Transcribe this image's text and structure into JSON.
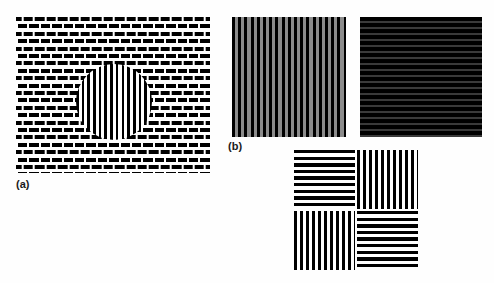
{
  "figure": {
    "background_color": "#ffffff",
    "width": 494,
    "height": 283,
    "panels": [
      {
        "id": "a",
        "label": "(a)",
        "kind": "plaid-checkerboard-with-circular-inset",
        "description": "Square-wave checkerboard grating field with a circular inset region of pure vertical grating",
        "colors": {
          "bar": "#000000",
          "gap": "#ffffff"
        },
        "inset": {
          "shape": "circle",
          "orientation": "vertical",
          "bar_color": "#000000",
          "gap_color": "#ffffff"
        }
      },
      {
        "id": "b",
        "label": "(b)",
        "kind": "grating-pair",
        "description": "Pair of square-wave gratings: vertical black-on-gray and horizontal dark",
        "items": [
          {
            "name": "vertical-grating",
            "orientation": "vertical",
            "bar_color": "#000000",
            "gap_color": "#8c8c8c"
          },
          {
            "name": "horizontal-grating",
            "orientation": "horizontal",
            "bar_color": "#000000",
            "gap_color": "#3a3a3a"
          }
        ]
      },
      {
        "id": "c",
        "label": "",
        "kind": "quadrant-grating",
        "description": "Square divided into four quadrants of alternating grating orientation",
        "quadrants": [
          {
            "position": "top-left",
            "orientation": "horizontal"
          },
          {
            "position": "top-right",
            "orientation": "vertical"
          },
          {
            "position": "bottom-left",
            "orientation": "vertical"
          },
          {
            "position": "bottom-right",
            "orientation": "horizontal"
          }
        ],
        "colors": {
          "bar": "#000000",
          "gap": "#ffffff"
        }
      }
    ]
  },
  "labels": {
    "a": "(a)",
    "b": "(b)"
  }
}
